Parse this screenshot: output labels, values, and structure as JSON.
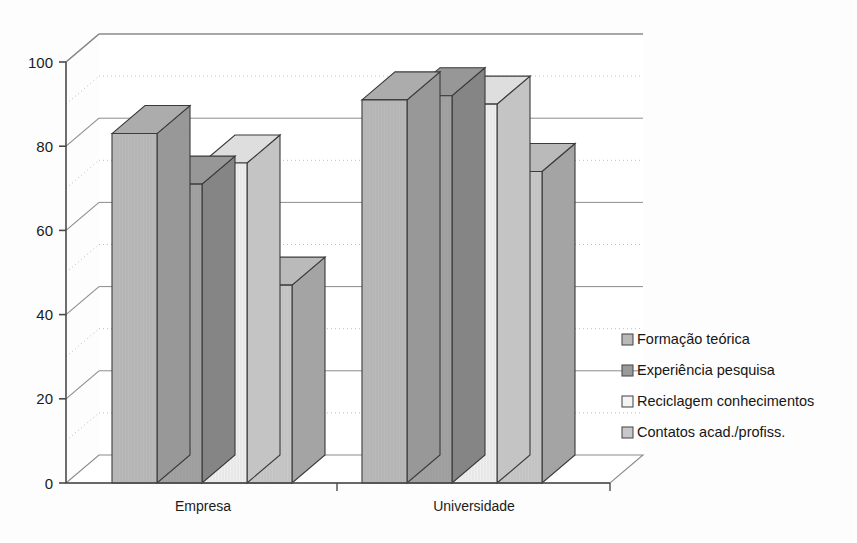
{
  "chart_data": {
    "type": "bar",
    "title": "",
    "subtitle": "",
    "xlabel": "",
    "ylabel": "",
    "categories": [
      "Empresa",
      "Universidade"
    ],
    "series": [
      {
        "name": "Formação teórica",
        "values": [
          83,
          91
        ],
        "color": "#b9b9b9"
      },
      {
        "name": "Experiência pesquisa",
        "values": [
          71,
          92
        ],
        "color": "#a2a2a2"
      },
      {
        "name": "Reciclagem conhecimentos",
        "values": [
          76,
          90
        ],
        "color": "#efefef"
      },
      {
        "name": "Contatos acad./profiss.",
        "values": [
          47,
          74
        ],
        "color": "#c8c8c8"
      }
    ],
    "ylim": [
      0,
      100
    ],
    "y_ticks": [
      "0",
      "20",
      "40",
      "60",
      "80",
      "100"
    ],
    "y_tick_values": [
      0,
      20,
      40,
      60,
      80,
      100
    ],
    "minor_gridlines": [
      10,
      30,
      50,
      70,
      90
    ],
    "grid": true,
    "grid_major_style": "solid",
    "grid_minor_style": "dotted",
    "legend_position": "right",
    "three_d": true
  },
  "legend": {
    "items": [
      {
        "label": "Formação teórica",
        "swatch": "#b9b9b9"
      },
      {
        "label": "Experiência pesquisa",
        "swatch": "#9a9a9a"
      },
      {
        "label": "Reciclagem conhecimentos",
        "swatch": "#f4f4f4"
      },
      {
        "label": "Contatos acad./profiss.",
        "swatch": "#c8c8c8"
      }
    ]
  },
  "axis": {
    "y_labels": [
      "100",
      "80",
      "60",
      "40",
      "20",
      "0"
    ],
    "x_labels": [
      "Empresa",
      "Universidade"
    ]
  },
  "colors": {
    "axis_line": "#4a4a4a",
    "grid_major": "#8c8c8c",
    "grid_minor": "#bdbdbd",
    "bar_edge": "#3a3a3a",
    "text": "#1b1b1b",
    "background": "#fdfdfd"
  }
}
